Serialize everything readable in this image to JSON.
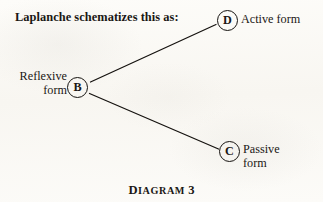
{
  "page": {
    "background_color": "#fbfaf7",
    "ink_color": "#15120f"
  },
  "intro": {
    "text": "Laplanche schematizes this as:"
  },
  "diagram": {
    "nodes": [
      {
        "id": "B",
        "letter": "B",
        "label_line1": "Reflexive",
        "label_line2": "form",
        "label_position": "left"
      },
      {
        "id": "D",
        "letter": "D",
        "label_line1": "Active form",
        "label_line2": "",
        "label_position": "right"
      },
      {
        "id": "C",
        "letter": "C",
        "label_line1": "Passive",
        "label_line2": "form",
        "label_position": "right"
      }
    ],
    "edges": [
      {
        "from": "B",
        "to": "D"
      },
      {
        "from": "B",
        "to": "C"
      }
    ]
  },
  "caption": {
    "initial": "D",
    "rest": "IAGRAM",
    "number": "3"
  }
}
